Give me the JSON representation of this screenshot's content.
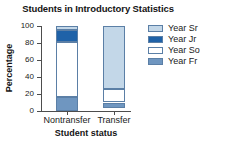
{
  "chart_data": {
    "type": "bar",
    "stacked": true,
    "title": "Students in Introductory Statistics",
    "xlabel": "Student status",
    "ylabel": "Percentage",
    "categories": [
      "Nontransfer",
      "Transfer"
    ],
    "yticks": [
      0,
      20,
      40,
      60,
      80,
      100
    ],
    "ylim": [
      0,
      100
    ],
    "grid": false,
    "legend_position": "right",
    "series": [
      {
        "name": "Year Sr",
        "color": "#c3d7e8",
        "values": [
          5,
          74
        ]
      },
      {
        "name": "Year Jr",
        "color": "#1f62a8",
        "values": [
          14,
          0
        ]
      },
      {
        "name": "Year So",
        "color": "#ffffff",
        "values": [
          64,
          16
        ]
      },
      {
        "name": "Year Fr",
        "color": "#6f96c0",
        "values": [
          17,
          7
        ]
      }
    ]
  },
  "legend": {
    "items": [
      {
        "label": "Year Sr"
      },
      {
        "label": "Year Jr"
      },
      {
        "label": "Year So"
      },
      {
        "label": "Year Fr"
      }
    ]
  }
}
